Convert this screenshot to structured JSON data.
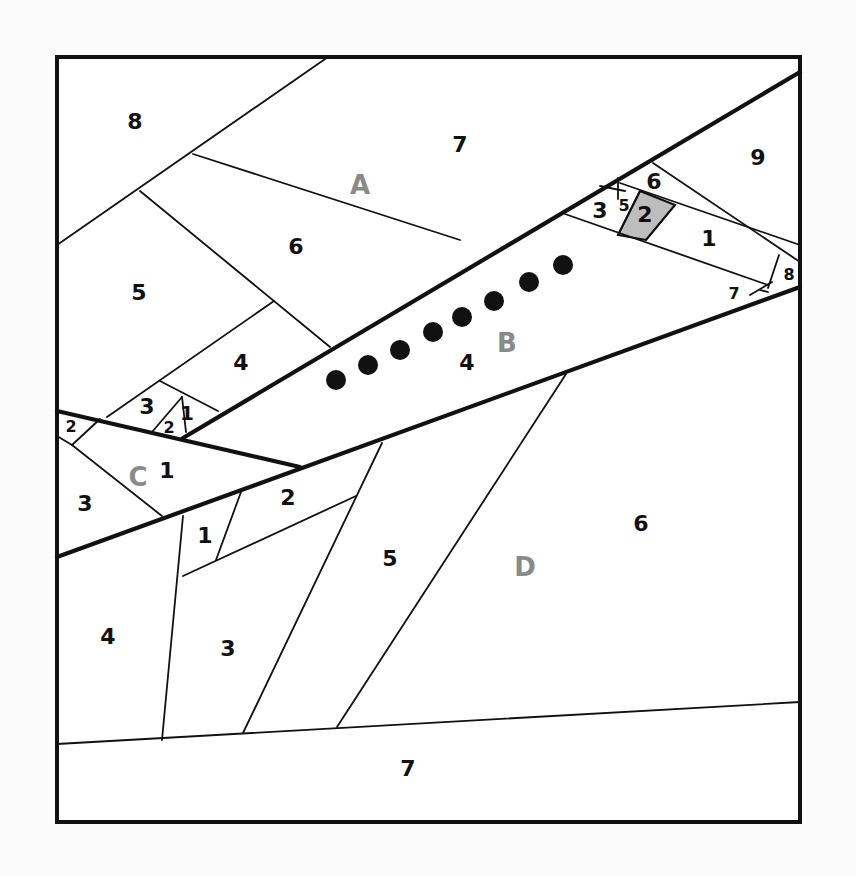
{
  "diagram": {
    "colors": {
      "line": "#111111",
      "background": "#ffffff",
      "shaded": "#bdbdbd",
      "section_label": "#8a8a8a",
      "dot": "#111111"
    },
    "frame": {
      "x": 57,
      "y": 57,
      "w": 743,
      "h": 765
    },
    "section_labels": [
      {
        "id": "A",
        "text": "A",
        "x": 360,
        "y": 185,
        "size": 26
      },
      {
        "id": "B",
        "text": "B",
        "x": 507,
        "y": 343,
        "size": 26
      },
      {
        "id": "C",
        "text": "C",
        "x": 138,
        "y": 477,
        "size": 26
      },
      {
        "id": "D",
        "text": "D",
        "x": 525,
        "y": 567,
        "size": 26
      }
    ],
    "piece_labels": [
      {
        "section": "A",
        "text": "8",
        "x": 135,
        "y": 121,
        "size": 22
      },
      {
        "section": "A",
        "text": "7",
        "x": 460,
        "y": 144,
        "size": 22
      },
      {
        "section": "A",
        "text": "6",
        "x": 296,
        "y": 246,
        "size": 22
      },
      {
        "section": "A",
        "text": "5",
        "x": 139,
        "y": 292,
        "size": 22
      },
      {
        "section": "A",
        "text": "4",
        "x": 241,
        "y": 362,
        "size": 22
      },
      {
        "section": "A",
        "text": "3",
        "x": 147,
        "y": 406,
        "size": 22
      },
      {
        "section": "A",
        "text": "2",
        "x": 169,
        "y": 427,
        "size": 16
      },
      {
        "section": "A",
        "text": "1",
        "x": 187,
        "y": 413,
        "size": 20
      },
      {
        "section": "A",
        "text": "2",
        "x": 71,
        "y": 426,
        "size": 16
      },
      {
        "section": "B",
        "text": "4",
        "x": 467,
        "y": 362,
        "size": 22
      },
      {
        "section": "B",
        "text": "9",
        "x": 758,
        "y": 157,
        "size": 22
      },
      {
        "section": "B",
        "text": "6",
        "x": 654,
        "y": 181,
        "size": 22
      },
      {
        "section": "B",
        "text": "3",
        "x": 600,
        "y": 210,
        "size": 22
      },
      {
        "section": "B",
        "text": "5",
        "x": 624,
        "y": 205,
        "size": 16
      },
      {
        "section": "B",
        "text": "2",
        "x": 645,
        "y": 214,
        "size": 22
      },
      {
        "section": "B",
        "text": "1",
        "x": 709,
        "y": 238,
        "size": 22
      },
      {
        "section": "B",
        "text": "8",
        "x": 789,
        "y": 274,
        "size": 16
      },
      {
        "section": "B",
        "text": "7",
        "x": 734,
        "y": 293,
        "size": 16
      },
      {
        "section": "C",
        "text": "1",
        "x": 167,
        "y": 470,
        "size": 22
      },
      {
        "section": "C",
        "text": "3",
        "x": 85,
        "y": 503,
        "size": 22
      },
      {
        "section": "D",
        "text": "2",
        "x": 288,
        "y": 497,
        "size": 22
      },
      {
        "section": "D",
        "text": "1",
        "x": 205,
        "y": 535,
        "size": 22
      },
      {
        "section": "D",
        "text": "5",
        "x": 390,
        "y": 558,
        "size": 22
      },
      {
        "section": "D",
        "text": "6",
        "x": 641,
        "y": 523,
        "size": 22
      },
      {
        "section": "D",
        "text": "4",
        "x": 108,
        "y": 636,
        "size": 22
      },
      {
        "section": "D",
        "text": "3",
        "x": 228,
        "y": 648,
        "size": 22
      },
      {
        "section": "D",
        "text": "7",
        "x": 408,
        "y": 768,
        "size": 22
      }
    ],
    "section_seams": [
      [
        57,
        411,
        300,
        467
      ],
      [
        183,
        438,
        800,
        72
      ],
      [
        57,
        557,
        800,
        287
      ]
    ],
    "piece_seams": [
      [
        57,
        245,
        328,
        57
      ],
      [
        193,
        154,
        460,
        240
      ],
      [
        140,
        191,
        330,
        347
      ],
      [
        274,
        301,
        107,
        417
      ],
      [
        160,
        381,
        218,
        411
      ],
      [
        152,
        432,
        182,
        397
      ],
      [
        182,
        397,
        186,
        432
      ],
      [
        57,
        436,
        72,
        445
      ],
      [
        72,
        445,
        100,
        419
      ],
      [
        72,
        445,
        162,
        516
      ],
      [
        565,
        214,
        768,
        285
      ],
      [
        620,
        183,
        800,
        245
      ],
      [
        653,
        163,
        800,
        262
      ],
      [
        600,
        186,
        625,
        191
      ],
      [
        618,
        178,
        618,
        199
      ],
      [
        640,
        191,
        618,
        235
      ],
      [
        675,
        205,
        646,
        240
      ],
      [
        779,
        255,
        768,
        288
      ],
      [
        750,
        295,
        772,
        282
      ],
      [
        760,
        290,
        768,
        292
      ],
      [
        57,
        744,
        800,
        702
      ],
      [
        162,
        740,
        183,
        516
      ],
      [
        183,
        576,
        356,
        496
      ],
      [
        216,
        560,
        241,
        492
      ],
      [
        243,
        733,
        382,
        443
      ],
      [
        337,
        727,
        566,
        374
      ]
    ],
    "shaded_piece": {
      "points": "640,191 675,205 646,240 618,235"
    },
    "dots": [
      {
        "x": 336,
        "y": 380,
        "r": 10
      },
      {
        "x": 368,
        "y": 365,
        "r": 10
      },
      {
        "x": 400,
        "y": 350,
        "r": 10
      },
      {
        "x": 433,
        "y": 332,
        "r": 10
      },
      {
        "x": 462,
        "y": 317,
        "r": 10
      },
      {
        "x": 494,
        "y": 301,
        "r": 10
      },
      {
        "x": 529,
        "y": 282,
        "r": 10
      },
      {
        "x": 563,
        "y": 265,
        "r": 10
      }
    ]
  }
}
